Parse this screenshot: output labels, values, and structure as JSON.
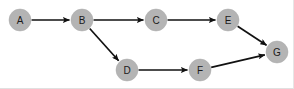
{
  "diagram": {
    "type": "node-link-diagram",
    "background_color": "#ffffff",
    "node_fill_color": "#b4b4b4",
    "node_label_color": "#1a1a1a",
    "edge_color": "#111111",
    "node_radius": 11,
    "nodes": [
      {
        "id": "A",
        "label": "A",
        "cx": 20,
        "cy": 20
      },
      {
        "id": "B",
        "label": "B",
        "cx": 82,
        "cy": 20
      },
      {
        "id": "C",
        "label": "C",
        "cx": 156,
        "cy": 20
      },
      {
        "id": "D",
        "label": "D",
        "cx": 127,
        "cy": 70
      },
      {
        "id": "E",
        "label": "E",
        "cx": 228,
        "cy": 20
      },
      {
        "id": "F",
        "label": "F",
        "cx": 200,
        "cy": 70
      },
      {
        "id": "G",
        "label": "G",
        "cx": 277,
        "cy": 52
      }
    ],
    "edges": [
      {
        "from": "A",
        "to": "B",
        "directed": true
      },
      {
        "from": "B",
        "to": "C",
        "directed": true
      },
      {
        "from": "B",
        "to": "D",
        "directed": true
      },
      {
        "from": "C",
        "to": "E",
        "directed": true
      },
      {
        "from": "D",
        "to": "F",
        "directed": true
      },
      {
        "from": "E",
        "to": "G",
        "directed": true
      },
      {
        "from": "F",
        "to": "G",
        "directed": true
      }
    ]
  }
}
